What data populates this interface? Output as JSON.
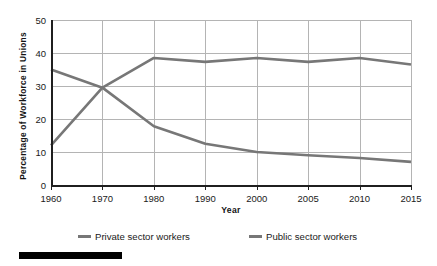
{
  "chart_data": {
    "type": "line",
    "title": "",
    "xlabel": "Year",
    "ylabel": "Percentage of Workforce in Unions",
    "categories": [
      "1960",
      "1970",
      "1980",
      "1990",
      "2000",
      "2005",
      "2010",
      "2015"
    ],
    "x_tick_labels": [
      "1960",
      "1970",
      "1980",
      "1990",
      "2000",
      "2005",
      "2010",
      "2015"
    ],
    "y_tick_labels": [
      "0",
      "10",
      "20",
      "30",
      "40",
      "50"
    ],
    "y_ticks": [
      0,
      10,
      20,
      30,
      40,
      50
    ],
    "ylim": [
      0,
      50
    ],
    "grid": "both",
    "legend_position": "bottom",
    "series": [
      {
        "name": "Private sector workers",
        "color": "#777777",
        "values": [
          35.0,
          29.5,
          17.8,
          12.5,
          10.0,
          9.0,
          8.2,
          7.0
        ]
      },
      {
        "name": "Public sector workers",
        "color": "#777777",
        "values": [
          12.0,
          29.5,
          38.5,
          37.3,
          38.5,
          37.3,
          38.5,
          36.5
        ]
      }
    ]
  },
  "axes": {
    "y_title": "Percentage of Workforce in Unions",
    "x_title": "Year"
  },
  "legend": {
    "items": [
      {
        "label": "Private sector workers"
      },
      {
        "label": "Public sector workers"
      }
    ]
  },
  "decoration": {
    "bottom_bar_color": "#000000"
  },
  "colors": {
    "line": "#777777",
    "grid": "#b4b4b4",
    "axis": "#1f1f1f",
    "text": "#1a1a1a"
  }
}
